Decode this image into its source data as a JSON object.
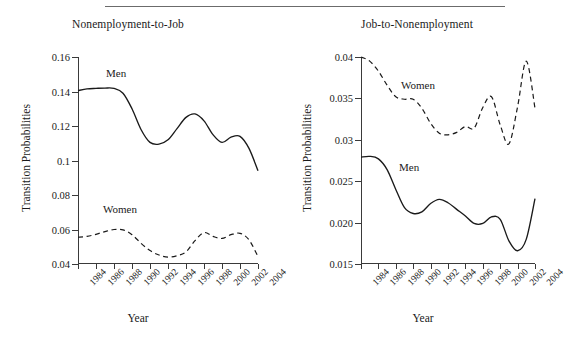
{
  "figure": {
    "has_top_rule": true,
    "background": "#ffffff",
    "ink_color": "#1a1a1a"
  },
  "panels": [
    {
      "key": "left",
      "title": "Nonemployment-to-Job",
      "ylabel": "Transition Probabilities",
      "xlabel": "Year",
      "yticks": [
        "0.16",
        "0.14",
        "0.12",
        "0.1",
        "0.08",
        "0.06",
        "0.04"
      ],
      "xticks": [
        "1984",
        "1986",
        "1988",
        "1990",
        "1992",
        "1994",
        "1996",
        "1998",
        "2000",
        "2002",
        "2004"
      ],
      "series_labels": [
        {
          "name": "Men",
          "text": "Men"
        },
        {
          "name": "Women",
          "text": "Women"
        }
      ]
    },
    {
      "key": "right",
      "title": "Job-to-Nonemployment",
      "ylabel": "Transition Probabilities",
      "xlabel": "Year",
      "yticks": [
        "0.04",
        "0.035",
        "0.03",
        "0.025",
        "0.020",
        "0.015"
      ],
      "xticks": [
        "1984",
        "1986",
        "1988",
        "1990",
        "1992",
        "1994",
        "1996",
        "1998",
        "2000",
        "2002",
        "2004"
      ],
      "series_labels": [
        {
          "name": "Women",
          "text": "Women"
        },
        {
          "name": "Men",
          "text": "Men"
        }
      ]
    }
  ],
  "chart_data": [
    {
      "type": "line",
      "title": "Nonemployment-to-Job",
      "xlabel": "Year",
      "ylabel": "Transition Probabilities",
      "xlim": [
        1984,
        2004
      ],
      "ylim": [
        0.04,
        0.16
      ],
      "yticks": [
        0.16,
        0.14,
        0.12,
        0.1,
        0.08,
        0.06,
        0.04
      ],
      "xticks": [
        1984,
        1986,
        1988,
        1990,
        1992,
        1994,
        1996,
        1998,
        2000,
        2002,
        2004
      ],
      "grid": false,
      "legend": "inline-annotations",
      "x": [
        1984,
        1985,
        1986,
        1987,
        1988,
        1989,
        1990,
        1991,
        1992,
        1993,
        1994,
        1995,
        1996,
        1997,
        1998,
        1999,
        2000,
        2001,
        2002,
        2003,
        2004
      ],
      "series": [
        {
          "name": "Men",
          "style": "solid",
          "values": [
            0.1405,
            0.1415,
            0.1418,
            0.142,
            0.1418,
            0.139,
            0.13,
            0.118,
            0.1105,
            0.1095,
            0.112,
            0.1185,
            0.125,
            0.127,
            0.123,
            0.115,
            0.1105,
            0.1135,
            0.114,
            0.107,
            0.094
          ]
        },
        {
          "name": "Women",
          "style": "dashed",
          "values": [
            0.0555,
            0.056,
            0.0572,
            0.0588,
            0.06,
            0.0598,
            0.057,
            0.052,
            0.0478,
            0.0452,
            0.044,
            0.0448,
            0.047,
            0.0535,
            0.0582,
            0.056,
            0.0548,
            0.057,
            0.0578,
            0.054,
            0.0443
          ]
        }
      ]
    },
    {
      "type": "line",
      "title": "Job-to-Nonemployment",
      "xlabel": "Year",
      "ylabel": "Transition Probabilities",
      "xlim": [
        1984,
        2004
      ],
      "ylim": [
        0.015,
        0.04
      ],
      "yticks": [
        0.04,
        0.035,
        0.03,
        0.025,
        0.02,
        0.015
      ],
      "xticks": [
        1984,
        1986,
        1988,
        1990,
        1992,
        1994,
        1996,
        1998,
        2000,
        2002,
        2004
      ],
      "grid": false,
      "legend": "inline-annotations",
      "x": [
        1984,
        1985,
        1986,
        1987,
        1988,
        1989,
        1990,
        1991,
        1992,
        1993,
        1994,
        1995,
        1996,
        1997,
        1998,
        1999,
        2000,
        2001,
        2002,
        2003,
        2004
      ],
      "series": [
        {
          "name": "Women",
          "style": "dashed",
          "values": [
            0.04,
            0.0395,
            0.0383,
            0.0366,
            0.0352,
            0.0349,
            0.0349,
            0.0338,
            0.032,
            0.0308,
            0.0306,
            0.0309,
            0.0316,
            0.0314,
            0.0339,
            0.0352,
            0.0318,
            0.0295,
            0.034,
            0.0395,
            0.0338
          ]
        },
        {
          "name": "Men",
          "style": "solid",
          "values": [
            0.0279,
            0.028,
            0.0277,
            0.0264,
            0.024,
            0.0218,
            0.0211,
            0.0213,
            0.0223,
            0.0228,
            0.0224,
            0.0216,
            0.0208,
            0.0199,
            0.0199,
            0.0207,
            0.0204,
            0.0178,
            0.0166,
            0.018,
            0.0229
          ]
        }
      ]
    }
  ]
}
